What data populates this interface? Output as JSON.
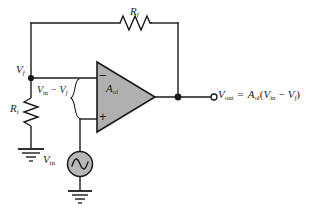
{
  "figure": {
    "kind": "op-amp-negative-feedback-circuit",
    "background_color": "#ffffff",
    "wire_color": "#1a1a1a",
    "opamp_fill_color": "#b0b0b0"
  },
  "labels": {
    "feedback_resistor": "R",
    "feedback_resistor_sub": "f",
    "input_resistor": "R",
    "input_resistor_sub": "i",
    "feedback_node": "V",
    "feedback_node_sub": "f",
    "opamp_gain": "A",
    "opamp_gain_sub": "ol",
    "source": "V",
    "source_sub": "in",
    "diff_lead": "V",
    "diff_lead_sub": "in",
    "diff_minus": "−",
    "diff_trail": "V",
    "diff_trail_sub": "f",
    "out_name": "V",
    "out_name_sub": "out",
    "out_equals": "=",
    "out_gain": "A",
    "out_gain_sub": "ol",
    "out_open_paren": "(",
    "out_term1": "V",
    "out_term1_sub": "in",
    "out_minus": "−",
    "out_term2": "V",
    "out_term2_sub": "f",
    "out_close_paren": ")",
    "inverting_sign": "−",
    "noninverting_sign": "+"
  },
  "components": {
    "rf": {
      "name": "feedback-resistor",
      "orientation": "horizontal"
    },
    "ri": {
      "name": "input-resistor",
      "orientation": "vertical"
    },
    "opamp": {
      "name": "operational-amplifier",
      "shape": "triangle"
    },
    "vin_source": {
      "name": "ac-voltage-source",
      "shape": "circle-sine"
    },
    "ground_ri": {
      "name": "ground-symbol"
    },
    "ground_source": {
      "name": "ground-symbol"
    },
    "node_vf": {
      "name": "junction-dot"
    },
    "node_vout": {
      "name": "junction-dot"
    },
    "terminal_vout": {
      "name": "open-terminal"
    },
    "brace_diff": {
      "name": "differential-input-brace"
    }
  }
}
